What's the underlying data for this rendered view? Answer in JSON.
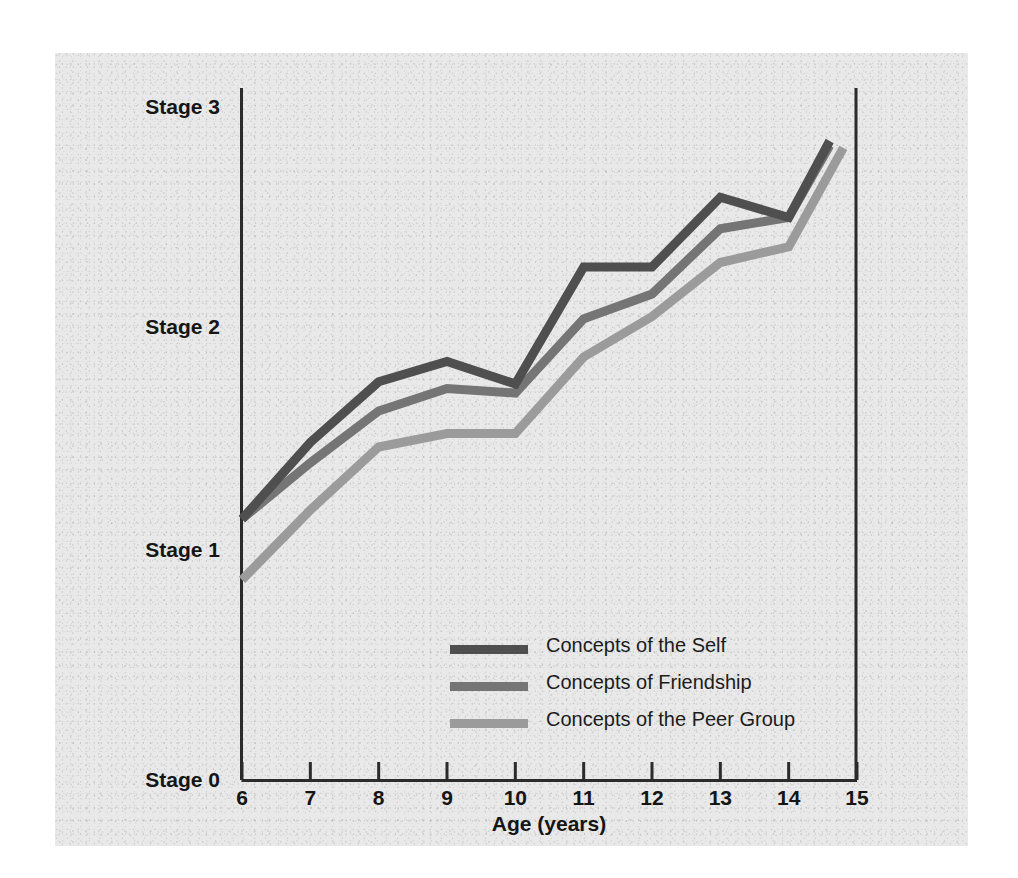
{
  "chart_data": {
    "type": "line",
    "title": "",
    "xlabel": "Age (years)",
    "ylabel": "",
    "xlim": [
      6,
      15
    ],
    "ylim": [
      0,
      3
    ],
    "grid": false,
    "legend_position": "inside-bottom-center",
    "x_tick_labels": [
      "6",
      "7",
      "8",
      "9",
      "10",
      "11",
      "12",
      "13",
      "14",
      "15"
    ],
    "x_ticks": [
      6,
      7,
      8,
      9,
      10,
      11,
      12,
      13,
      14,
      15
    ],
    "y_tick_labels": [
      "Stage 3",
      "Stage 2",
      "Stage 1",
      "Stage 0"
    ],
    "y_ticks": [
      3,
      2,
      1,
      0
    ],
    "series": [
      {
        "name": "Concepts of the Self",
        "color": "#4f4f4f",
        "x": [
          6,
          7,
          8,
          9,
          10,
          11,
          12,
          13,
          14,
          14.6
        ],
        "values": [
          1.16,
          1.5,
          1.77,
          1.86,
          1.76,
          2.28,
          2.28,
          2.59,
          2.5,
          2.84
        ]
      },
      {
        "name": "Concepts of Friendship",
        "color": "#757575",
        "x": [
          6,
          7,
          8,
          9,
          10,
          11,
          12,
          13,
          14,
          14.6
        ],
        "values": [
          1.16,
          1.41,
          1.64,
          1.74,
          1.72,
          2.05,
          2.16,
          2.45,
          2.5,
          2.82
        ]
      },
      {
        "name": "Concepts of the Peer Group",
        "color": "#9b9b9b",
        "x": [
          6,
          7,
          8,
          9,
          10,
          11,
          12,
          13,
          14,
          14.8
        ],
        "values": [
          0.89,
          1.2,
          1.48,
          1.54,
          1.54,
          1.88,
          2.06,
          2.3,
          2.37,
          2.81
        ]
      }
    ]
  },
  "axis": {
    "x_title": "Age (years)"
  },
  "legend": {
    "items": [
      {
        "label": "Concepts of the Self",
        "color": "#4f4f4f"
      },
      {
        "label": "Concepts of Friendship",
        "color": "#757575"
      },
      {
        "label": "Concepts of the Peer Group",
        "color": "#9b9b9b"
      }
    ]
  },
  "colors": {
    "self": "#4f4f4f",
    "friendship": "#757575",
    "peer_group": "#9b9b9b",
    "axis": "#2b2b2b",
    "paper": "#e9e9e9",
    "text": "#151515"
  }
}
